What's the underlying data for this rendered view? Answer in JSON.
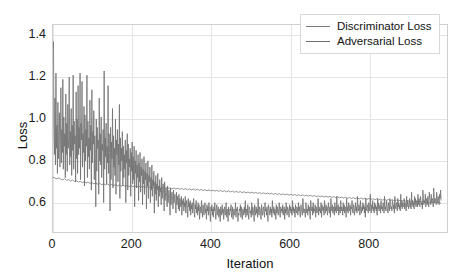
{
  "chart_data": {
    "type": "line",
    "title": "",
    "xlabel": "Iteration",
    "ylabel": "Loss",
    "xlim": [
      0,
      1000
    ],
    "ylim": [
      0.45,
      1.45
    ],
    "xticks": [
      "0",
      "200",
      "400",
      "600",
      "800"
    ],
    "xtick_values": [
      0,
      200,
      400,
      600,
      800
    ],
    "yticks": [
      "0.6",
      "0.8",
      "1.0",
      "1.2",
      "1.4"
    ],
    "ytick_values": [
      0.6,
      0.8,
      1.0,
      1.2,
      1.4
    ],
    "grid": true,
    "legend_position": "upper right",
    "series": [
      {
        "name": "Discriminator Loss",
        "color": "#7a7a7a",
        "values": [
          0.722,
          0.718,
          0.714,
          0.719,
          0.712,
          0.709,
          0.715,
          0.706,
          0.711,
          0.703,
          0.708,
          0.701,
          0.705,
          0.698,
          0.702,
          0.696,
          0.7,
          0.694,
          0.698,
          0.692,
          0.696,
          0.69,
          0.694,
          0.688,
          0.692,
          0.686,
          0.69,
          0.685,
          0.689,
          0.683,
          0.687,
          0.682,
          0.686,
          0.68,
          0.684,
          0.679,
          0.683,
          0.678,
          0.682,
          0.677,
          0.681,
          0.676,
          0.68,
          0.675,
          0.679,
          0.674,
          0.678,
          0.673,
          0.677,
          0.672,
          0.676,
          0.671,
          0.675,
          0.67,
          0.674,
          0.669,
          0.673,
          0.668,
          0.672,
          0.667,
          0.671,
          0.666,
          0.67,
          0.665,
          0.669,
          0.664,
          0.668,
          0.663,
          0.667,
          0.662,
          0.666,
          0.661,
          0.665,
          0.66,
          0.664,
          0.659,
          0.663,
          0.658,
          0.662,
          0.657,
          0.661,
          0.656,
          0.66,
          0.655,
          0.659,
          0.654,
          0.658,
          0.653,
          0.657,
          0.652,
          0.656,
          0.651,
          0.655,
          0.65,
          0.654,
          0.649,
          0.653,
          0.648,
          0.652,
          0.647,
          0.651,
          0.646,
          0.65,
          0.645,
          0.649,
          0.644,
          0.648,
          0.643,
          0.647,
          0.642,
          0.646,
          0.641,
          0.645,
          0.64,
          0.644,
          0.639,
          0.643,
          0.638,
          0.642,
          0.637,
          0.641,
          0.636,
          0.64,
          0.635,
          0.639,
          0.634,
          0.638,
          0.633,
          0.637,
          0.632,
          0.636,
          0.631,
          0.635,
          0.63,
          0.634,
          0.629,
          0.633,
          0.628,
          0.632,
          0.627,
          0.631,
          0.626,
          0.63,
          0.625,
          0.629,
          0.624,
          0.628,
          0.623,
          0.627,
          0.622,
          0.626,
          0.621,
          0.625,
          0.62,
          0.624,
          0.619,
          0.623,
          0.618,
          0.622,
          0.617,
          0.621,
          0.616,
          0.62,
          0.615,
          0.619,
          0.614,
          0.618,
          0.613,
          0.617,
          0.612,
          0.616,
          0.611,
          0.615,
          0.61,
          0.614,
          0.609,
          0.613,
          0.608,
          0.612,
          0.607,
          0.611,
          0.606,
          0.61,
          0.605,
          0.609,
          0.604,
          0.608,
          0.603,
          0.607,
          0.602,
          0.606,
          0.601,
          0.605,
          0.6,
          0.604,
          0.599,
          0.603,
          0.598,
          0.602,
          0.597
        ]
      },
      {
        "name": "Adversarial Loss",
        "color": "#6e6e6e",
        "values": [
          1.34,
          1.37,
          0.95,
          0.83,
          1.1,
          0.78,
          1.22,
          0.86,
          0.97,
          0.74,
          1.08,
          0.81,
          0.92,
          1.03,
          0.77,
          0.88,
          1.15,
          0.79,
          0.95,
          0.84,
          1.19,
          0.76,
          1.01,
          0.87,
          0.93,
          0.72,
          1.12,
          0.83,
          0.98,
          0.75,
          1.07,
          0.86,
          0.91,
          1.2,
          0.78,
          0.94,
          0.82,
          1.05,
          0.73,
          0.97,
          0.85,
          1.21,
          0.76,
          0.99,
          0.88,
          0.92,
          0.7,
          1.13,
          0.81,
          1.0,
          0.74,
          1.16,
          0.83,
          0.96,
          0.86,
          1.22,
          0.71,
          0.98,
          0.9,
          1.18,
          0.77,
          0.93,
          0.84,
          1.06,
          0.68,
          1.02,
          0.8,
          0.95,
          0.87,
          1.21,
          0.72,
          0.99,
          0.82,
          0.91,
          0.76,
          1.09,
          0.85,
          0.97,
          0.66,
          1.14,
          0.79,
          0.94,
          0.88,
          1.04,
          0.71,
          0.92,
          0.83,
          0.58,
          1.0,
          0.75,
          0.96,
          0.86,
          0.9,
          0.64,
          1.1,
          0.8,
          0.93,
          0.78,
          1.01,
          0.72,
          0.88,
          0.85,
          0.95,
          0.6,
          1.23,
          0.76,
          0.91,
          0.82,
          0.98,
          0.69,
          0.87,
          0.79,
          1.16,
          0.74,
          0.93,
          0.84,
          0.56,
          0.96,
          0.71,
          0.89,
          0.81,
          1.05,
          0.67,
          0.92,
          0.77,
          0.86,
          0.73,
          1.0,
          0.64,
          0.9,
          0.83,
          0.95,
          0.7,
          0.88,
          0.78,
          1.07,
          0.62,
          0.91,
          0.75,
          0.86,
          0.8,
          0.94,
          0.68,
          0.87,
          0.72,
          0.83,
          0.76,
          0.9,
          0.6,
          0.85,
          0.79,
          0.93,
          0.66,
          0.88,
          0.73,
          0.81,
          0.77,
          0.86,
          0.63,
          0.84,
          0.75,
          0.89,
          0.69,
          0.82,
          0.71,
          0.87,
          0.58,
          0.8,
          0.74,
          0.85,
          0.67,
          0.78,
          0.72,
          0.83,
          0.61,
          0.79,
          0.7,
          0.84,
          0.65,
          0.77,
          0.73,
          0.81,
          0.59,
          0.76,
          0.69,
          0.82,
          0.64,
          0.75,
          0.71,
          0.79,
          0.57,
          0.74,
          0.68,
          0.8,
          0.62,
          0.73,
          0.7,
          0.77,
          0.6,
          0.72,
          0.66,
          0.78,
          0.63,
          0.71,
          0.68,
          0.75,
          0.55,
          0.7,
          0.64,
          0.73,
          0.61,
          0.69,
          0.66,
          0.74,
          0.58,
          0.68,
          0.63,
          0.71,
          0.65,
          0.67,
          0.59,
          0.72,
          0.62,
          0.66,
          0.69,
          0.64,
          0.56,
          0.7,
          0.61,
          0.65,
          0.67,
          0.63,
          0.58,
          0.68,
          0.6,
          0.64,
          0.66,
          0.62,
          0.54,
          0.67,
          0.59,
          0.63,
          0.65,
          0.61,
          0.57,
          0.66,
          0.6,
          0.62,
          0.64,
          0.58,
          0.55,
          0.65,
          0.59,
          0.63,
          0.61,
          0.57,
          0.64,
          0.56,
          0.62,
          0.6,
          0.58,
          0.63,
          0.54,
          0.61,
          0.59,
          0.62,
          0.56,
          0.6,
          0.58,
          0.63,
          0.55,
          0.59,
          0.61,
          0.57,
          0.53,
          0.62,
          0.58,
          0.6,
          0.56,
          0.61,
          0.54,
          0.59,
          0.57,
          0.6,
          0.55,
          0.58,
          0.62,
          0.56,
          0.53,
          0.59,
          0.57,
          0.61,
          0.55,
          0.58,
          0.54,
          0.6,
          0.56,
          0.59,
          0.52,
          0.57,
          0.58,
          0.55,
          0.61,
          0.56,
          0.53,
          0.59,
          0.57,
          0.54,
          0.58,
          0.6,
          0.55,
          0.57,
          0.52,
          0.59,
          0.56,
          0.58,
          0.54,
          0.6,
          0.57,
          0.55,
          0.51,
          0.58,
          0.56,
          0.59,
          0.54,
          0.57,
          0.53,
          0.58,
          0.56,
          0.6,
          0.55,
          0.52,
          0.57,
          0.59,
          0.54,
          0.56,
          0.58,
          0.53,
          0.55,
          0.57,
          0.51,
          0.58,
          0.56,
          0.54,
          0.59,
          0.55,
          0.57,
          0.52,
          0.56,
          0.58,
          0.54,
          0.55,
          0.6,
          0.53,
          0.57,
          0.56,
          0.51,
          0.58,
          0.55,
          0.54,
          0.57,
          0.56,
          0.59,
          0.53,
          0.55,
          0.58,
          0.52,
          0.56,
          0.57,
          0.54,
          0.55,
          0.6,
          0.53,
          0.57,
          0.56,
          0.58,
          0.51,
          0.55,
          0.54,
          0.57,
          0.56,
          0.59,
          0.53,
          0.58,
          0.55,
          0.52,
          0.57,
          0.56,
          0.54,
          0.58,
          0.55,
          0.61,
          0.53,
          0.57,
          0.56,
          0.54,
          0.59,
          0.55,
          0.52,
          0.58,
          0.57,
          0.55,
          0.56,
          0.53,
          0.6,
          0.54,
          0.58,
          0.57,
          0.55,
          0.51,
          0.59,
          0.56,
          0.54,
          0.58,
          0.55,
          0.57,
          0.53,
          0.62,
          0.56,
          0.54,
          0.58,
          0.57,
          0.55,
          0.52,
          0.59,
          0.56,
          0.54,
          0.57,
          0.58,
          0.55,
          0.53,
          0.6,
          0.56,
          0.57,
          0.54,
          0.58,
          0.55,
          0.51,
          0.59,
          0.57,
          0.56,
          0.54,
          0.58,
          0.55,
          0.57,
          0.53,
          0.61,
          0.56,
          0.55,
          0.58,
          0.54,
          0.57,
          0.56,
          0.52,
          0.59,
          0.55,
          0.58,
          0.56,
          0.54,
          0.57,
          0.6,
          0.55,
          0.53,
          0.58,
          0.56,
          0.57,
          0.55,
          0.59,
          0.54,
          0.56,
          0.58,
          0.52,
          0.57,
          0.55,
          0.6,
          0.56,
          0.54,
          0.58,
          0.57,
          0.55,
          0.53,
          0.59,
          0.56,
          0.58,
          0.55,
          0.57,
          0.54,
          0.61,
          0.56,
          0.58,
          0.55,
          0.57,
          0.53,
          0.59,
          0.56,
          0.55,
          0.58,
          0.57,
          0.54,
          0.6,
          0.56,
          0.58,
          0.55,
          0.53,
          0.59,
          0.57,
          0.56,
          0.54,
          0.62,
          0.58,
          0.55,
          0.57,
          0.56,
          0.53,
          0.6,
          0.58,
          0.55,
          0.57,
          0.54,
          0.59,
          0.56,
          0.58,
          0.55,
          0.52,
          0.61,
          0.57,
          0.56,
          0.58,
          0.54,
          0.6,
          0.55,
          0.57,
          0.56,
          0.59,
          0.53,
          0.58,
          0.56,
          0.55,
          0.57,
          0.62,
          0.54,
          0.58,
          0.56,
          0.57,
          0.55,
          0.6,
          0.53,
          0.59,
          0.57,
          0.56,
          0.58,
          0.54,
          0.61,
          0.57,
          0.55,
          0.59,
          0.56,
          0.58,
          0.54,
          0.57,
          0.6,
          0.56,
          0.55,
          0.58,
          0.53,
          0.62,
          0.57,
          0.56,
          0.59,
          0.55,
          0.58,
          0.57,
          0.54,
          0.6,
          0.56,
          0.58,
          0.55,
          0.63,
          0.57,
          0.56,
          0.59,
          0.54,
          0.58,
          0.57,
          0.55,
          0.61,
          0.56,
          0.58,
          0.57,
          0.54,
          0.6,
          0.56,
          0.59,
          0.55,
          0.58,
          0.57,
          0.53,
          0.62,
          0.56,
          0.58,
          0.55,
          0.6,
          0.57,
          0.56,
          0.59,
          0.54,
          0.58,
          0.57,
          0.61,
          0.56,
          0.55,
          0.59,
          0.58,
          0.54,
          0.57,
          0.6,
          0.56,
          0.58,
          0.55,
          0.63,
          0.57,
          0.56,
          0.59,
          0.58,
          0.54,
          0.61,
          0.57,
          0.55,
          0.58,
          0.56,
          0.6,
          0.57,
          0.59,
          0.55,
          0.58,
          0.53,
          0.62,
          0.57,
          0.56,
          0.59,
          0.58,
          0.55,
          0.6,
          0.57,
          0.56,
          0.64,
          0.58,
          0.55,
          0.59,
          0.57,
          0.61,
          0.56,
          0.58,
          0.55,
          0.6,
          0.57,
          0.59,
          0.56,
          0.58,
          0.54,
          0.62,
          0.57,
          0.6,
          0.56,
          0.58,
          0.59,
          0.55,
          0.61,
          0.57,
          0.58,
          0.56,
          0.6,
          0.59,
          0.55,
          0.63,
          0.57,
          0.58,
          0.56,
          0.61,
          0.59,
          0.57,
          0.55,
          0.6,
          0.58,
          0.56,
          0.62,
          0.59,
          0.57,
          0.58,
          0.56,
          0.61,
          0.6,
          0.57,
          0.59,
          0.55,
          0.63,
          0.58,
          0.57,
          0.6,
          0.59,
          0.56,
          0.62,
          0.58,
          0.6,
          0.57,
          0.59,
          0.56,
          0.64,
          0.58,
          0.61,
          0.57,
          0.6,
          0.59,
          0.58,
          0.62,
          0.57,
          0.6,
          0.59,
          0.56,
          0.63,
          0.58,
          0.61,
          0.6,
          0.57,
          0.59,
          0.62,
          0.58,
          0.6,
          0.57,
          0.65,
          0.59,
          0.61,
          0.58,
          0.6,
          0.57,
          0.63,
          0.59,
          0.62,
          0.58,
          0.6,
          0.61,
          0.58,
          0.64,
          0.59,
          0.62,
          0.6,
          0.58,
          0.63,
          0.61,
          0.59,
          0.6,
          0.57,
          0.66,
          0.62,
          0.59,
          0.61,
          0.6,
          0.64,
          0.58,
          0.62,
          0.61,
          0.59,
          0.63,
          0.6,
          0.58,
          0.65,
          0.62,
          0.61,
          0.59,
          0.64,
          0.6,
          0.62,
          0.61,
          0.58,
          0.67,
          0.63,
          0.6,
          0.62,
          0.61,
          0.59,
          0.65,
          0.62,
          0.6,
          0.63,
          0.61,
          0.59,
          0.64,
          0.62,
          0.66,
          0.61
        ]
      }
    ]
  },
  "legend": {
    "items": [
      {
        "label": "Discriminator Loss"
      },
      {
        "label": "Adversarial Loss"
      }
    ]
  }
}
